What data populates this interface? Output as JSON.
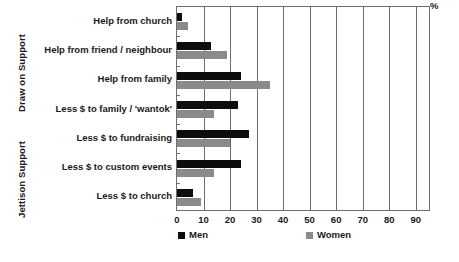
{
  "chart_data": {
    "type": "bar",
    "orientation": "horizontal",
    "title": "",
    "xlabel": "%",
    "ylabel": "",
    "xlim": [
      0,
      95
    ],
    "grid": true,
    "grid_axis": "x",
    "legend_position": "bottom",
    "xticks": [
      0,
      10,
      20,
      30,
      40,
      50,
      60,
      70,
      80,
      90
    ],
    "xtick_labels": [
      "0",
      "10",
      "20",
      "30",
      "40",
      "50",
      "60",
      "70",
      "80",
      "90"
    ],
    "categories": [
      "Help from church",
      "Help from friend / neighbour",
      "Help from family",
      "Less $ to family / 'wantok'",
      "Less $ to fundraising",
      "Less $ to custom events",
      "Less $ to church"
    ],
    "series": [
      {
        "name": "Men",
        "color": "#0d0d0d",
        "values": [
          2,
          13,
          24,
          23,
          27,
          24,
          6
        ]
      },
      {
        "name": "Women",
        "color": "#8a8a8a",
        "values": [
          4,
          19,
          35,
          14,
          20,
          14,
          9
        ]
      }
    ],
    "group_axis_titles": [
      {
        "label": "Draw on Support",
        "categories": [
          "Help from church",
          "Help from friend / neighbour",
          "Help from family"
        ]
      },
      {
        "label": "Jettison Support",
        "categories": [
          "Less $ to family / 'wantok'",
          "Less $ to fundraising",
          "Less $ to custom events",
          "Less $ to church"
        ]
      }
    ]
  },
  "legend": {
    "men_label": "Men",
    "women_label": "Women"
  },
  "axis": {
    "unit_label": "%"
  }
}
